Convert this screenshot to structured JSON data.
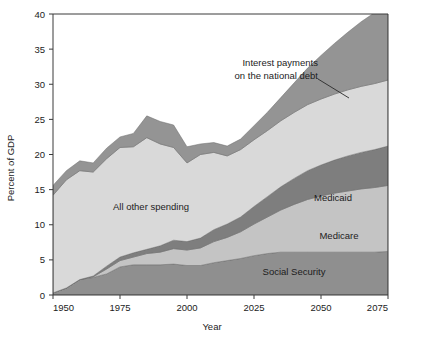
{
  "chart_data": {
    "type": "area",
    "stacked": true,
    "title": "",
    "xlabel": "Year",
    "ylabel": "Percent of GDP",
    "xlim": [
      1950,
      2075
    ],
    "ylim": [
      0,
      40
    ],
    "xticks": [
      1950,
      1975,
      2000,
      2025,
      2050,
      2075
    ],
    "xtick_labels": [
      "1950",
      "1975",
      "2000",
      "2025",
      "2050",
      "2075"
    ],
    "yticks": [
      0,
      5,
      10,
      15,
      20,
      25,
      30,
      35,
      40
    ],
    "ytick_labels": [
      "0",
      "5",
      "10",
      "15",
      "20",
      "25",
      "30",
      "35",
      "40"
    ],
    "grid": false,
    "legend": "inline-labels",
    "x": [
      1950,
      1955,
      1960,
      1965,
      1970,
      1975,
      1980,
      1985,
      1990,
      1995,
      2000,
      2005,
      2010,
      2015,
      2020,
      2025,
      2030,
      2035,
      2040,
      2045,
      2050,
      2055,
      2060,
      2065,
      2070,
      2075
    ],
    "series": [
      {
        "name": "Social Security",
        "label": "Social Security",
        "color": "#8f8f8f",
        "values": [
          0.3,
          1.0,
          2.2,
          2.5,
          3.0,
          4.0,
          4.3,
          4.3,
          4.3,
          4.4,
          4.2,
          4.2,
          4.6,
          4.9,
          5.2,
          5.6,
          5.9,
          6.1,
          6.1,
          6.1,
          6.1,
          6.1,
          6.1,
          6.1,
          6.1,
          6.2
        ]
      },
      {
        "name": "Medicare",
        "label": "Medicare",
        "color": "#c4c4c4",
        "values": [
          0.0,
          0.0,
          0.0,
          0.1,
          0.7,
          0.9,
          1.1,
          1.6,
          1.8,
          2.2,
          2.2,
          2.5,
          3.0,
          3.3,
          3.8,
          4.5,
          5.2,
          6.0,
          6.8,
          7.5,
          8.0,
          8.4,
          8.7,
          9.0,
          9.2,
          9.4
        ]
      },
      {
        "name": "Medicaid",
        "label": "Medicaid",
        "color": "#7e7e7e",
        "values": [
          0.0,
          0.0,
          0.0,
          0.1,
          0.4,
          0.5,
          0.6,
          0.6,
          0.9,
          1.2,
          1.2,
          1.4,
          1.7,
          1.9,
          2.1,
          2.5,
          2.9,
          3.3,
          3.7,
          4.1,
          4.4,
          4.7,
          5.0,
          5.2,
          5.4,
          5.6
        ]
      },
      {
        "name": "All other spending",
        "label": "All other spending",
        "color": "#d9d9d9",
        "values": [
          13.9,
          15.4,
          15.5,
          14.8,
          15.3,
          15.6,
          15.1,
          15.9,
          14.5,
          13.2,
          11.2,
          11.9,
          11.0,
          9.7,
          9.6,
          9.5,
          9.4,
          9.4,
          9.4,
          9.4,
          9.4,
          9.4,
          9.4,
          9.4,
          9.4,
          9.4
        ]
      },
      {
        "name": "Interest payments on the national debt",
        "label": "Interest payments\non the national debt",
        "color": "#949494",
        "values": [
          1.4,
          1.3,
          1.4,
          1.3,
          1.5,
          1.5,
          1.9,
          3.1,
          3.2,
          3.2,
          2.3,
          1.5,
          1.4,
          1.4,
          1.5,
          2.0,
          2.6,
          3.3,
          4.2,
          5.2,
          6.2,
          7.2,
          8.2,
          9.2,
          10.1,
          10.4
        ]
      }
    ],
    "annotations": [
      {
        "name": "interest-payments-callout",
        "text_line_1": "Interest payments",
        "text_line_2": "on the national debt",
        "leader_from": [
          318,
          79
        ],
        "leader_to": [
          349,
          98
        ]
      }
    ],
    "series_inline_labels": [
      {
        "name": "all-other-spending",
        "text": "All other spending",
        "x": 151,
        "y": 210
      },
      {
        "name": "medicaid",
        "text": "Medicaid",
        "x": 333,
        "y": 201
      },
      {
        "name": "medicare",
        "text": "Medicare",
        "x": 339,
        "y": 239
      },
      {
        "name": "social-security",
        "text": "Social Security",
        "x": 294,
        "y": 275
      }
    ]
  },
  "figure": {
    "background_color": "#ffffff",
    "plot_border_color": "#3a3a3a"
  }
}
